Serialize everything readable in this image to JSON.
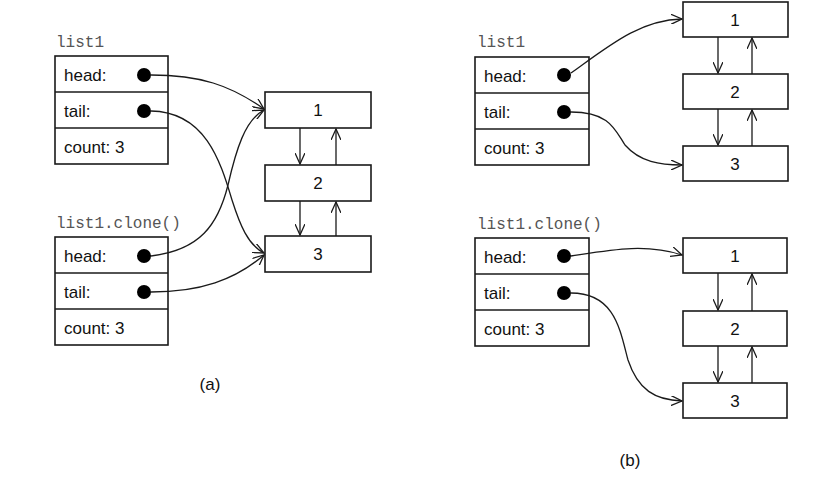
{
  "panels": [
    {
      "caption": "(a)",
      "structs": [
        {
          "title": "list1",
          "fields": [
            {
              "label": "head:",
              "pointer": true
            },
            {
              "label": "tail:",
              "pointer": true
            },
            {
              "label": "count: 3",
              "pointer": false
            }
          ]
        },
        {
          "title": "list1.clone()",
          "fields": [
            {
              "label": "head:",
              "pointer": true
            },
            {
              "label": "tail:",
              "pointer": true
            },
            {
              "label": "count: 3",
              "pointer": false
            }
          ]
        }
      ],
      "node_groups": [
        {
          "nodes": [
            "1",
            "2",
            "3"
          ]
        }
      ],
      "description": "Shallow clone: both list1 and its clone point to the same nodes"
    },
    {
      "caption": "(b)",
      "structs": [
        {
          "title": "list1",
          "fields": [
            {
              "label": "head:",
              "pointer": true
            },
            {
              "label": "tail:",
              "pointer": true
            },
            {
              "label": "count: 3",
              "pointer": false
            }
          ]
        },
        {
          "title": "list1.clone()",
          "fields": [
            {
              "label": "head:",
              "pointer": true
            },
            {
              "label": "tail:",
              "pointer": true
            },
            {
              "label": "count: 3",
              "pointer": false
            }
          ]
        }
      ],
      "node_groups": [
        {
          "nodes": [
            "1",
            "2",
            "3"
          ]
        },
        {
          "nodes": [
            "1",
            "2",
            "3"
          ]
        }
      ],
      "description": "Deep clone: each list has its own copy of the nodes"
    }
  ]
}
